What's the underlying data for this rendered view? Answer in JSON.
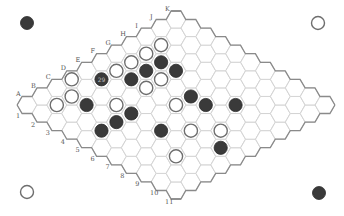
{
  "game": "Hex",
  "board": {
    "size": 11,
    "columns": [
      "A",
      "B",
      "C",
      "D",
      "E",
      "F",
      "G",
      "H",
      "I",
      "J",
      "K"
    ],
    "rows": [
      "1",
      "2",
      "3",
      "4",
      "5",
      "6",
      "7",
      "8",
      "9",
      "10",
      "11"
    ],
    "colors": {
      "black_stone": "#3a3a3a",
      "white_stone_fill": "#ffffff",
      "white_stone_stroke": "#6e6e6e",
      "cell_stroke": "#d4d4d4",
      "edge_stroke": "#8a8a8a"
    }
  },
  "stones": {
    "black": [
      "E2",
      "F3",
      "G3",
      "H3",
      "H4",
      "C3",
      "C5",
      "B5",
      "D5",
      "G6",
      "G7",
      "H8",
      "D7",
      "E10"
    ],
    "white": [
      "D1",
      "B2",
      "C2",
      "F2",
      "G2",
      "H2",
      "I2",
      "F4",
      "G4",
      "D4",
      "F6",
      "E8",
      "F9",
      "C9"
    ]
  },
  "labeled_stones": [
    {
      "cell": "E2",
      "color": "black",
      "text": "29"
    }
  ],
  "corner_markers": {
    "top_left": "black",
    "top_right": "white",
    "bottom_left": "white",
    "bottom_right": "black"
  }
}
